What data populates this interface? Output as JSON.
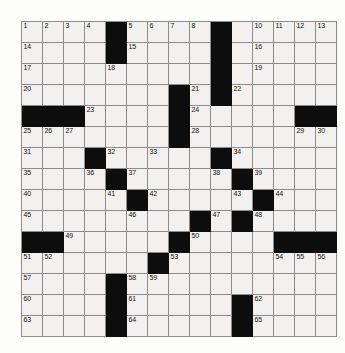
{
  "puzzle": {
    "kind": "crossword-grid",
    "rows": 15,
    "cols": 15,
    "cell_size_px": 21,
    "colors": {
      "page_background": "#ffffff",
      "grid_background": "#fdfdfc",
      "empty_cell": "#f2f1ef",
      "block_cell": "#0d0d0d",
      "grid_line": "#8d8d8d",
      "number_text": "#111111"
    },
    "total_numbers": 65,
    "blocks": [
      [
        1,
        5
      ],
      [
        1,
        10
      ],
      [
        2,
        5
      ],
      [
        2,
        10
      ],
      [
        3,
        10
      ],
      [
        4,
        8
      ],
      [
        4,
        10
      ],
      [
        5,
        1
      ],
      [
        5,
        2
      ],
      [
        5,
        3
      ],
      [
        5,
        8
      ],
      [
        5,
        14
      ],
      [
        5,
        15
      ],
      [
        6,
        8
      ],
      [
        7,
        4
      ],
      [
        7,
        10
      ],
      [
        8,
        5
      ],
      [
        8,
        11
      ],
      [
        9,
        6
      ],
      [
        9,
        12
      ],
      [
        10,
        9
      ],
      [
        10,
        11
      ],
      [
        11,
        1
      ],
      [
        11,
        2
      ],
      [
        11,
        8
      ],
      [
        11,
        13
      ],
      [
        11,
        14
      ],
      [
        11,
        15
      ],
      [
        12,
        7
      ],
      [
        13,
        5
      ],
      [
        14,
        5
      ],
      [
        14,
        11
      ],
      [
        15,
        5
      ],
      [
        15,
        11
      ]
    ],
    "numbers": [
      {
        "n": "1",
        "row": 1,
        "col": 1
      },
      {
        "n": "2",
        "row": 1,
        "col": 2
      },
      {
        "n": "3",
        "row": 1,
        "col": 3
      },
      {
        "n": "4",
        "row": 1,
        "col": 4
      },
      {
        "n": "5",
        "row": 1,
        "col": 6
      },
      {
        "n": "6",
        "row": 1,
        "col": 7
      },
      {
        "n": "7",
        "row": 1,
        "col": 8
      },
      {
        "n": "8",
        "row": 1,
        "col": 9
      },
      {
        "n": "9",
        "row": 1,
        "col": 10
      },
      {
        "n": "10",
        "row": 1,
        "col": 12
      },
      {
        "n": "11",
        "row": 1,
        "col": 13
      },
      {
        "n": "12",
        "row": 1,
        "col": 14
      },
      {
        "n": "13",
        "row": 1,
        "col": 15
      },
      {
        "n": "14",
        "row": 2,
        "col": 1
      },
      {
        "n": "15",
        "row": 2,
        "col": 6
      },
      {
        "n": "16",
        "row": 2,
        "col": 12
      },
      {
        "n": "17",
        "row": 3,
        "col": 1
      },
      {
        "n": "18",
        "row": 3,
        "col": 5
      },
      {
        "n": "19",
        "row": 3,
        "col": 12
      },
      {
        "n": "20",
        "row": 4,
        "col": 1
      },
      {
        "n": "21",
        "row": 4,
        "col": 9
      },
      {
        "n": "22",
        "row": 4,
        "col": 11
      },
      {
        "n": "23",
        "row": 5,
        "col": 4
      },
      {
        "n": "24",
        "row": 5,
        "col": 9
      },
      {
        "n": "25",
        "row": 6,
        "col": 1
      },
      {
        "n": "26",
        "row": 6,
        "col": 2
      },
      {
        "n": "27",
        "row": 6,
        "col": 3
      },
      {
        "n": "28",
        "row": 6,
        "col": 9
      },
      {
        "n": "29",
        "row": 6,
        "col": 14
      },
      {
        "n": "30",
        "row": 6,
        "col": 15
      },
      {
        "n": "31",
        "row": 7,
        "col": 1
      },
      {
        "n": "32",
        "row": 7,
        "col": 5
      },
      {
        "n": "33",
        "row": 7,
        "col": 7
      },
      {
        "n": "34",
        "row": 7,
        "col": 11
      },
      {
        "n": "35",
        "row": 8,
        "col": 1
      },
      {
        "n": "36",
        "row": 8,
        "col": 4
      },
      {
        "n": "37",
        "row": 8,
        "col": 6
      },
      {
        "n": "38",
        "row": 8,
        "col": 10
      },
      {
        "n": "39",
        "row": 8,
        "col": 12
      },
      {
        "n": "40",
        "row": 9,
        "col": 1
      },
      {
        "n": "41",
        "row": 9,
        "col": 5
      },
      {
        "n": "42",
        "row": 9,
        "col": 7
      },
      {
        "n": "43",
        "row": 9,
        "col": 11
      },
      {
        "n": "44",
        "row": 9,
        "col": 13
      },
      {
        "n": "45",
        "row": 10,
        "col": 1
      },
      {
        "n": "46",
        "row": 10,
        "col": 6
      },
      {
        "n": "47",
        "row": 10,
        "col": 10
      },
      {
        "n": "48",
        "row": 10,
        "col": 12
      },
      {
        "n": "49",
        "row": 11,
        "col": 3
      },
      {
        "n": "50",
        "row": 11,
        "col": 9
      },
      {
        "n": "51",
        "row": 12,
        "col": 1
      },
      {
        "n": "52",
        "row": 12,
        "col": 2
      },
      {
        "n": "53",
        "row": 12,
        "col": 8
      },
      {
        "n": "54",
        "row": 12,
        "col": 13
      },
      {
        "n": "55",
        "row": 12,
        "col": 14
      },
      {
        "n": "56",
        "row": 12,
        "col": 15
      },
      {
        "n": "57",
        "row": 13,
        "col": 1
      },
      {
        "n": "58",
        "row": 13,
        "col": 6
      },
      {
        "n": "59",
        "row": 13,
        "col": 7
      },
      {
        "n": "60",
        "row": 14,
        "col": 1
      },
      {
        "n": "61",
        "row": 14,
        "col": 6
      },
      {
        "n": "62",
        "row": 14,
        "col": 12
      },
      {
        "n": "63",
        "row": 15,
        "col": 1
      },
      {
        "n": "64",
        "row": 15,
        "col": 6
      },
      {
        "n": "65",
        "row": 15,
        "col": 12
      }
    ]
  }
}
